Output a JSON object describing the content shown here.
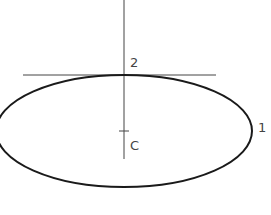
{
  "diagram": {
    "labels": {
      "point1": "1",
      "point2": "2",
      "center": "C"
    },
    "colors": {
      "ellipse": "#1a1a1a",
      "lines": "#444444",
      "text": "#444444"
    }
  }
}
